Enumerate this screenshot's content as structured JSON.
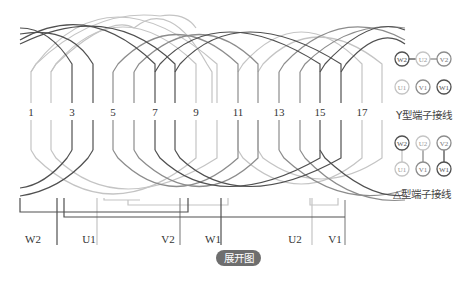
{
  "diagram": {
    "slot_count": 18,
    "slot_labels": [
      "1",
      "3",
      "5",
      "7",
      "9",
      "11",
      "13",
      "15",
      "17"
    ],
    "terminals_bottom": [
      {
        "label": "W2",
        "phase": "W"
      },
      {
        "label": "U1",
        "phase": "U"
      },
      {
        "label": "V2",
        "phase": "V"
      },
      {
        "label": "W1",
        "phase": "W"
      },
      {
        "label": "U2",
        "phase": "U"
      },
      {
        "label": "V1",
        "phase": "V"
      }
    ],
    "colors": {
      "U": "#c4c4c4",
      "V": "#8c8c8c",
      "W": "#505050"
    },
    "badge": "展开图"
  },
  "panel": {
    "y_connection": {
      "top_row": [
        "W2",
        "U2",
        "V2"
      ],
      "bottom_row": [
        "U1",
        "V1",
        "W1"
      ],
      "label": "Y型端子接线"
    },
    "delta_connection": {
      "top_row": [
        "W2",
        "U2",
        "V2"
      ],
      "bottom_row": [
        "U1",
        "V1",
        "W1"
      ],
      "label": "△型端子接线"
    }
  }
}
